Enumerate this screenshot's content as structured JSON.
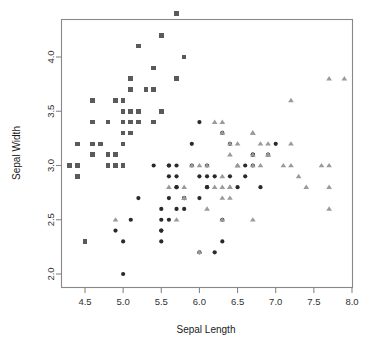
{
  "figure": {
    "width": 372,
    "height": 346,
    "background": "#ffffff",
    "frame_color": "#888888"
  },
  "chart_data": {
    "type": "scatter",
    "title": "",
    "xlabel": "Sepal Length",
    "ylabel": "Sepal Width",
    "xlim": [
      4.2,
      8.05
    ],
    "ylim": [
      1.92,
      4.48
    ],
    "xticks": [
      4.5,
      5.0,
      5.5,
      6.0,
      6.5,
      7.0,
      7.5,
      8.0
    ],
    "xtick_labels": [
      "4.5",
      "5.0",
      "5.5",
      "6.0",
      "6.5",
      "7.0",
      "7.5",
      "8.0"
    ],
    "yticks": [
      2.0,
      2.5,
      3.0,
      3.5,
      4.0
    ],
    "ytick_labels": [
      "2.0",
      "2.5",
      "3.0",
      "3.5",
      "4.0"
    ],
    "grid": false,
    "legend": "none",
    "series": [
      {
        "name": "setosa",
        "marker": "square",
        "color": "#5a5a5a",
        "size": 4.6,
        "points": [
          [
            5.1,
            3.5
          ],
          [
            4.9,
            3.0
          ],
          [
            4.7,
            3.2
          ],
          [
            4.6,
            3.1
          ],
          [
            5.0,
            3.6
          ],
          [
            5.4,
            3.9
          ],
          [
            4.6,
            3.4
          ],
          [
            5.0,
            3.4
          ],
          [
            4.4,
            2.9
          ],
          [
            4.9,
            3.1
          ],
          [
            5.4,
            3.7
          ],
          [
            4.8,
            3.4
          ],
          [
            4.8,
            3.0
          ],
          [
            4.3,
            3.0
          ],
          [
            5.8,
            4.0
          ],
          [
            5.7,
            4.4
          ],
          [
            5.4,
            3.9
          ],
          [
            5.1,
            3.5
          ],
          [
            5.7,
            3.8
          ],
          [
            5.1,
            3.8
          ],
          [
            5.4,
            3.4
          ],
          [
            5.1,
            3.7
          ],
          [
            4.6,
            3.6
          ],
          [
            5.1,
            3.3
          ],
          [
            4.8,
            3.4
          ],
          [
            5.0,
            3.0
          ],
          [
            5.0,
            3.4
          ],
          [
            5.2,
            3.5
          ],
          [
            5.2,
            3.4
          ],
          [
            4.7,
            3.2
          ],
          [
            4.8,
            3.1
          ],
          [
            5.4,
            3.4
          ],
          [
            5.2,
            4.1
          ],
          [
            5.5,
            4.2
          ],
          [
            4.9,
            3.1
          ],
          [
            5.0,
            3.2
          ],
          [
            5.5,
            3.5
          ],
          [
            4.9,
            3.6
          ],
          [
            4.4,
            3.0
          ],
          [
            5.1,
            3.4
          ],
          [
            5.0,
            3.5
          ],
          [
            4.5,
            2.3
          ],
          [
            4.4,
            3.2
          ],
          [
            5.0,
            3.5
          ],
          [
            5.1,
            3.8
          ],
          [
            4.8,
            3.0
          ],
          [
            5.1,
            3.8
          ],
          [
            4.6,
            3.2
          ],
          [
            5.3,
            3.7
          ],
          [
            5.0,
            3.3
          ]
        ]
      },
      {
        "name": "versicolor",
        "marker": "circle",
        "color": "#2a2a2a",
        "size": 4.2,
        "points": [
          [
            7.0,
            3.2
          ],
          [
            6.4,
            3.2
          ],
          [
            6.9,
            3.1
          ],
          [
            5.5,
            2.3
          ],
          [
            6.5,
            2.8
          ],
          [
            5.7,
            2.8
          ],
          [
            6.3,
            3.3
          ],
          [
            4.9,
            2.4
          ],
          [
            6.6,
            2.9
          ],
          [
            5.2,
            2.7
          ],
          [
            5.0,
            2.0
          ],
          [
            5.9,
            3.0
          ],
          [
            6.0,
            2.2
          ],
          [
            6.1,
            2.9
          ],
          [
            5.6,
            2.9
          ],
          [
            6.7,
            3.1
          ],
          [
            5.6,
            3.0
          ],
          [
            5.8,
            2.7
          ],
          [
            6.2,
            2.2
          ],
          [
            5.6,
            2.5
          ],
          [
            5.9,
            3.2
          ],
          [
            6.1,
            2.8
          ],
          [
            6.3,
            2.5
          ],
          [
            6.1,
            2.8
          ],
          [
            6.4,
            2.9
          ],
          [
            6.6,
            3.0
          ],
          [
            6.8,
            2.8
          ],
          [
            6.7,
            3.0
          ],
          [
            6.0,
            2.9
          ],
          [
            5.7,
            2.6
          ],
          [
            5.5,
            2.4
          ],
          [
            5.5,
            2.4
          ],
          [
            5.8,
            2.7
          ],
          [
            6.0,
            2.7
          ],
          [
            5.4,
            3.0
          ],
          [
            6.0,
            3.4
          ],
          [
            6.7,
            3.1
          ],
          [
            6.3,
            2.3
          ],
          [
            5.6,
            3.0
          ],
          [
            5.5,
            2.5
          ],
          [
            5.5,
            2.6
          ],
          [
            6.1,
            3.0
          ],
          [
            5.8,
            2.6
          ],
          [
            5.0,
            2.3
          ],
          [
            5.6,
            2.7
          ],
          [
            5.7,
            3.0
          ],
          [
            5.7,
            2.9
          ],
          [
            6.2,
            2.9
          ],
          [
            5.1,
            2.5
          ],
          [
            5.7,
            2.8
          ]
        ]
      },
      {
        "name": "virginica",
        "marker": "triangle",
        "color": "#9a9a9a",
        "size": 4.6,
        "points": [
          [
            6.3,
            3.3
          ],
          [
            5.8,
            2.7
          ],
          [
            7.1,
            3.0
          ],
          [
            6.3,
            2.9
          ],
          [
            6.5,
            3.0
          ],
          [
            7.6,
            3.0
          ],
          [
            4.9,
            2.5
          ],
          [
            7.3,
            2.9
          ],
          [
            6.7,
            2.5
          ],
          [
            7.2,
            3.6
          ],
          [
            6.5,
            3.2
          ],
          [
            6.4,
            2.7
          ],
          [
            6.8,
            3.0
          ],
          [
            5.7,
            2.5
          ],
          [
            5.8,
            2.8
          ],
          [
            6.4,
            3.2
          ],
          [
            6.5,
            3.0
          ],
          [
            7.7,
            3.8
          ],
          [
            7.7,
            2.6
          ],
          [
            6.0,
            2.2
          ],
          [
            6.9,
            3.2
          ],
          [
            5.6,
            2.8
          ],
          [
            7.7,
            2.8
          ],
          [
            6.3,
            2.7
          ],
          [
            6.7,
            3.3
          ],
          [
            7.2,
            3.2
          ],
          [
            6.2,
            2.8
          ],
          [
            6.1,
            3.0
          ],
          [
            6.4,
            2.8
          ],
          [
            7.2,
            3.0
          ],
          [
            7.4,
            2.8
          ],
          [
            7.9,
            3.8
          ],
          [
            6.4,
            2.8
          ],
          [
            6.3,
            2.8
          ],
          [
            6.1,
            2.6
          ],
          [
            7.7,
            3.0
          ],
          [
            6.3,
            3.4
          ],
          [
            6.4,
            3.1
          ],
          [
            6.0,
            3.0
          ],
          [
            6.9,
            3.1
          ],
          [
            6.7,
            3.1
          ],
          [
            6.9,
            3.1
          ],
          [
            5.8,
            2.7
          ],
          [
            6.8,
            3.2
          ],
          [
            6.7,
            3.3
          ],
          [
            6.7,
            3.0
          ],
          [
            6.3,
            2.5
          ],
          [
            6.5,
            3.0
          ],
          [
            6.2,
            3.4
          ],
          [
            5.9,
            3.0
          ]
        ]
      }
    ]
  }
}
